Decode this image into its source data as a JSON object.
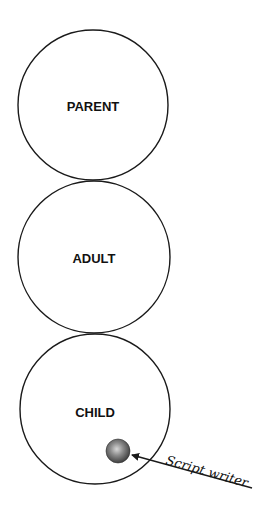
{
  "diagram": {
    "type": "ego-states-script-matrix",
    "background": "#ffffff",
    "stroke_color": "#1a1a1a",
    "ego_states": [
      {
        "label": "PARENT",
        "cx": 93,
        "cy": 105,
        "r": 75
      },
      {
        "label": "ADULT",
        "cx": 94,
        "cy": 256,
        "r": 76
      },
      {
        "label": "CHILD",
        "cx": 95,
        "cy": 408,
        "r": 75
      }
    ],
    "script_writer": {
      "label": "Script writer",
      "ball": {
        "cx": 118,
        "cy": 451,
        "r": 12
      },
      "arrow": {
        "x1": 252,
        "y1": 488,
        "x2": 132,
        "y2": 454
      }
    }
  }
}
